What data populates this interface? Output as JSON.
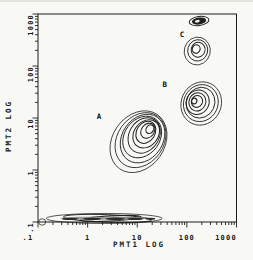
{
  "colors": {
    "background": "#f8f8f5",
    "ink": "#1f1f1f",
    "speckle_dark": "#2a2a2a",
    "speckle_gray": "#94948e"
  },
  "chart_data": {
    "type": "scatter",
    "subtype": "log-log contour density plot (flow cytometry)",
    "title": "",
    "xlabel": "PMT1 LOG",
    "ylabel": "PMT2 LOG",
    "x_scale": "log",
    "y_scale": "log",
    "xlim": [
      0.1,
      1000
    ],
    "ylim": [
      0.1,
      1000
    ],
    "grid": false,
    "x_ticks": {
      "values": [
        0.1,
        1,
        10,
        100,
        1000
      ],
      "labels": [
        ".1",
        "1",
        "10",
        "100",
        "1000"
      ]
    },
    "y_ticks": {
      "values": [
        0.1,
        1,
        10,
        100,
        1000
      ],
      "labels": [
        ".1",
        "1",
        "10",
        "100",
        "1000"
      ]
    },
    "clusters": [
      {
        "id": "cluster-A",
        "label": "A",
        "label_at": {
          "x": 1.7,
          "y": 10.5
        },
        "style": "contour",
        "levels": 9,
        "center": {
          "x": 11,
          "y": 3.5
        },
        "peak": {
          "x": 17.3,
          "y": 6.1
        },
        "rx_decades": 0.524,
        "ry_decades": 0.635,
        "rotation_deg": 35,
        "inner_scale": 0.14
      },
      {
        "id": "cluster-B",
        "label": "B",
        "label_at": {
          "x": 36,
          "y": 45
        },
        "style": "contour",
        "levels": 7,
        "center": {
          "x": 202,
          "y": 19
        },
        "peak": {
          "x": 146,
          "y": 21.2
        },
        "rx_decades": 0.403,
        "ry_decades": 0.423,
        "rotation_deg": 25,
        "inner_scale": 0.13
      },
      {
        "id": "cluster-C",
        "label": "C",
        "label_at": {
          "x": 80,
          "y": 395
        },
        "style": "contour",
        "levels": 4,
        "center": {
          "x": 168,
          "y": 194
        },
        "peak": {
          "x": 160,
          "y": 212
        },
        "rx_decades": 0.262,
        "ry_decades": 0.269,
        "rotation_deg": 15,
        "inner_scale": 0.3
      },
      {
        "id": "cluster-top-dense",
        "label": "",
        "style": "filled",
        "levels": 2,
        "center": {
          "x": 176,
          "y": 733
        },
        "peak": {
          "x": 176,
          "y": 733
        },
        "rx_decades": 0.2,
        "ry_decades": 0.0865,
        "rotation_deg": -8,
        "inner_scale": 0.3
      },
      {
        "id": "debris-band",
        "label": "",
        "style": "contour",
        "levels": 3,
        "center": {
          "x": 2.24,
          "y": 0.117
        },
        "peak": {
          "x": 2.82,
          "y": 0.117
        },
        "rx_decades": 1.169,
        "ry_decades": 0.096,
        "rotation_deg": 0,
        "inner_scale": 0.52
      },
      {
        "id": "origin-ring",
        "label": "",
        "style": "contour",
        "levels": 1,
        "center": {
          "x": 0.126,
          "y": 0.1
        },
        "peak": {
          "x": 0.126,
          "y": 0.1
        },
        "rx_decades": 0.0705,
        "ry_decades": 0.0615,
        "rotation_deg": 0,
        "inner_scale": 1
      }
    ],
    "band_speckles": [
      {
        "x": 1.0,
        "y": 0.118,
        "rx_decades": 0.55,
        "ry_px": 1.6,
        "color": "#9a9a94"
      },
      {
        "x": 6.0,
        "y": 0.118,
        "rx_decades": 0.45,
        "ry_px": 1.5,
        "color": "#8a8a84"
      },
      {
        "x": 0.44,
        "y": 0.115,
        "rx_decades": 0.17,
        "ry_px": 1.2,
        "color": "#2a2a2a"
      },
      {
        "x": 1.23,
        "y": 0.115,
        "rx_decades": 0.19,
        "ry_px": 1.3,
        "color": "#2a2a2a"
      },
      {
        "x": 3.6,
        "y": 0.115,
        "rx_decades": 0.2,
        "ry_px": 1.3,
        "color": "#2a2a2a"
      },
      {
        "x": 9.1,
        "y": 0.115,
        "rx_decades": 0.16,
        "ry_px": 1.2,
        "color": "#2a2a2a"
      },
      {
        "x": 18.3,
        "y": 0.115,
        "rx_decades": 0.1,
        "ry_px": 1.1,
        "color": "#2a2a2a"
      }
    ]
  }
}
